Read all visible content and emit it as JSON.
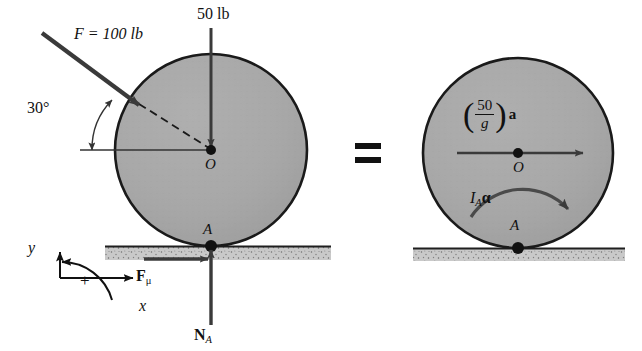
{
  "figure": {
    "equals_sign": "=",
    "colors": {
      "wheel_fill": "#a6a6a6",
      "wheel_stroke": "#1a1a1a",
      "ground_fill": "#c8c8c8",
      "arrow": "#3a3a3a",
      "text": "#111111"
    }
  },
  "left_diagram": {
    "name": "free-body-diagram",
    "applied_force": {
      "label": "F = 100 lb",
      "magnitude": 100,
      "unit": "lb",
      "symbol": "F",
      "angle_label": "30°",
      "angle_degrees": 30
    },
    "weight_force": {
      "label": "50 lb",
      "magnitude": 50,
      "unit": "lb"
    },
    "center_label": "O",
    "contact_label": "A",
    "friction_force": {
      "symbol": "F",
      "subscript": "μ"
    },
    "normal_force": {
      "symbol": "N",
      "subscript": "A"
    }
  },
  "right_diagram": {
    "name": "kinetic-diagram",
    "inertia_force": {
      "numerator": "50",
      "denominator": "g",
      "vector": "a"
    },
    "inertia_moment": {
      "symbol": "I",
      "subscript": "A",
      "alpha": "α"
    },
    "center_label": "O",
    "contact_label": "A"
  },
  "axes": {
    "x_label": "x",
    "y_label": "y",
    "positive_rotation_label": "+"
  }
}
